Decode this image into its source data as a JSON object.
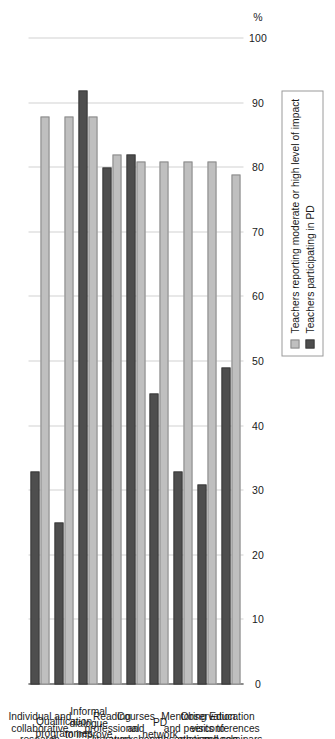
{
  "chart_data": {
    "type": "bar",
    "orientation": "horizontal",
    "title": "",
    "subtitle": "",
    "xlabel": "",
    "ylabel": "",
    "unit_label": "%",
    "grid": true,
    "legend_position": "top-left",
    "axis_range": [
      0,
      100
    ],
    "axis_ticks": [
      "0",
      "10",
      "20",
      "30",
      "40",
      "50",
      "60",
      "70",
      "80",
      "90",
      "100"
    ],
    "axis_tick_values": [
      0,
      10,
      20,
      30,
      40,
      50,
      60,
      70,
      80,
      90,
      100
    ],
    "categories": [
      "Individual and collaborative research",
      "Qualification programmes",
      "Informal dialogue to improve teaching",
      "Reading professional literature",
      "Courses and workshops",
      "PD network",
      "Mentoring and peer observation",
      "Observation visits to other schools",
      "Education conferences and seminars"
    ],
    "category_lines": [
      [
        "Individual and",
        "collaborative",
        "research"
      ],
      [
        "Qualification",
        "programmes"
      ],
      [
        "Informal",
        "dialogue",
        "to improve",
        "teaching"
      ],
      [
        "Reading",
        "professional",
        "literature"
      ],
      [
        "Courses",
        "and",
        "workshops"
      ],
      [
        "PD",
        "network"
      ],
      [
        "Mentoring",
        "and peer",
        "observation"
      ],
      [
        "Observation",
        "visits to",
        "other schools"
      ],
      [
        "Education",
        "conferences",
        "and seminars"
      ]
    ],
    "series": [
      {
        "name": "Teachers reporting moderate or high level of impact",
        "color": "#bfbfbf",
        "values": [
          88,
          88,
          88,
          82,
          81,
          81,
          81,
          81,
          79
        ]
      },
      {
        "name": "Teachers participating in PD",
        "color": "#4e4e4e",
        "values": [
          33,
          25,
          92,
          80,
          82,
          45,
          33,
          31,
          49
        ]
      }
    ]
  },
  "legend": {
    "items": [
      {
        "label": "Teachers reporting moderate or high level of impact",
        "swatch": "light"
      },
      {
        "label": "Teachers participating in PD",
        "swatch": "dark"
      }
    ]
  }
}
